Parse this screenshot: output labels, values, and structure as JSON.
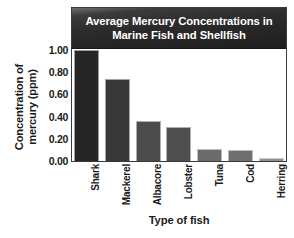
{
  "chart_data": {
    "type": "bar",
    "title": "Average Mercury Concentrations in Marine Fish and Shellfish",
    "title_lines": [
      "Average Mercury Concentrations in",
      "Marine Fish and Shellfish"
    ],
    "xlabel": "Type of fish",
    "ylabel": "Concentration of mercury (ppm)",
    "ylabel_lines": [
      "Concentration of",
      "mercury (ppm)"
    ],
    "categories": [
      "Shark",
      "Mackerel",
      "Albacore",
      "Lobster",
      "Tuna",
      "Cod",
      "Herring"
    ],
    "values": [
      0.98,
      0.73,
      0.35,
      0.3,
      0.11,
      0.1,
      0.03
    ],
    "ylim": [
      0.0,
      1.0
    ],
    "ytick_labels": [
      "1.00",
      "0.80",
      "0.60",
      "0.40",
      "0.20",
      "0.00"
    ],
    "ytick_values": [
      1.0,
      0.8,
      0.6,
      0.4,
      0.2,
      0.0
    ],
    "grid": false,
    "legend": "none",
    "bar_colors": [
      "#262626",
      "#383838",
      "#4b4b4b",
      "#4f4f4f",
      "#6b6b6b",
      "#6f6f6f",
      "#8f8f8f"
    ],
    "title_band_color": "#2b2b2b",
    "title_text_color": "#ffffff",
    "axis_color": "#3a3a3a",
    "background_color": "#ffffff"
  }
}
